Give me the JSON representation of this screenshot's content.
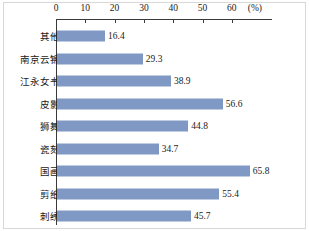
{
  "chart_data": {
    "type": "bar",
    "orientation": "horizontal",
    "title": "",
    "xlabel": "(%)",
    "ylabel": "",
    "unit": "(%)",
    "xlim": [
      0,
      70
    ],
    "xticks": [
      0,
      10,
      20,
      30,
      40,
      50,
      60
    ],
    "xtick_labels": [
      "0",
      "10",
      "20",
      "30",
      "40",
      "50",
      "60"
    ],
    "grid": false,
    "legend": "none",
    "axis_position": "top",
    "bar_color": "#8099c4",
    "categories": [
      "其他",
      "南京云锦",
      "江永女书",
      "皮影",
      "狮舞",
      "瓷刻",
      "国画",
      "剪纸",
      "刺绣"
    ],
    "values": [
      16.4,
      29.3,
      38.9,
      56.6,
      44.8,
      34.7,
      65.8,
      55.4,
      45.7
    ],
    "value_labels": [
      "16.4",
      "29.3",
      "38.9",
      "56.6",
      "44.8",
      "34.7",
      "65.8",
      "55.4",
      "45.7"
    ],
    "rows": [
      {
        "category": "其他",
        "value": 16.4,
        "label": "16.4"
      },
      {
        "category": "南京云锦",
        "value": 29.3,
        "label": "29.3"
      },
      {
        "category": "江永女书",
        "value": 38.9,
        "label": "38.9"
      },
      {
        "category": "皮影",
        "value": 56.6,
        "label": "56.6"
      },
      {
        "category": "狮舞",
        "value": 44.8,
        "label": "44.8"
      },
      {
        "category": "瓷刻",
        "value": 34.7,
        "label": "34.7"
      },
      {
        "category": "国画",
        "value": 65.8,
        "label": "65.8"
      },
      {
        "category": "剪纸",
        "value": 55.4,
        "label": "55.4"
      },
      {
        "category": "刺绣",
        "value": 45.7,
        "label": "45.7"
      }
    ]
  }
}
